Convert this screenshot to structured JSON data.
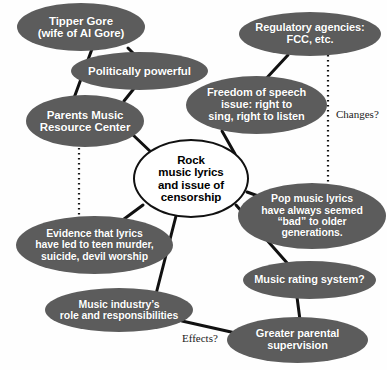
{
  "diagram": {
    "colors": {
      "oval_fill": "#5c5c5c",
      "oval_text": "#ffffff",
      "center_fill": "#ffffff",
      "center_text": "#000000",
      "edge": "#111111",
      "background": "#fefefe"
    },
    "nodes": [
      {
        "id": "tipper-gore",
        "label": "Tipper  Gore\n(wife of Al Gore)",
        "shape": "ellipse",
        "x": 17,
        "y": 3,
        "w": 128,
        "h": 48,
        "font_size": 11.5
      },
      {
        "id": "politically-powerful",
        "label": "Politically powerful",
        "shape": "ellipse",
        "x": 71,
        "y": 52,
        "w": 137,
        "h": 38,
        "font_size": 11.5
      },
      {
        "id": "regulatory-agencies",
        "label": "Regulatory agencies:\nFCC, etc.",
        "shape": "ellipse",
        "x": 239,
        "y": 12,
        "w": 142,
        "h": 44,
        "font_size": 11
      },
      {
        "id": "freedom-of-speech",
        "label": "Freedom of speech\nissue: right to\nsing, right to listen",
        "shape": "ellipse",
        "x": 186,
        "y": 76,
        "w": 141,
        "h": 58,
        "font_size": 11
      },
      {
        "id": "parents-music-resource-center",
        "label": "Parents Music\nResource Center",
        "shape": "ellipse",
        "x": 26,
        "y": 95,
        "w": 118,
        "h": 52,
        "font_size": 11.5
      },
      {
        "id": "rock-music-lyrics-censorship",
        "label": "Rock\nmusic lyrics\nand issue of\ncensorship",
        "shape": "circle",
        "x": 133,
        "y": 139,
        "w": 116,
        "h": 79,
        "font_size": 11.5
      },
      {
        "id": "pop-music-lyrics",
        "label": "Pop music lyrics\nhave always seemed\n“bad” to older\ngenerations.",
        "shape": "ellipse",
        "x": 238,
        "y": 183,
        "w": 148,
        "h": 66,
        "font_size": 10.5
      },
      {
        "id": "evidence-that-lyrics",
        "label": "Evidence that lyrics\nhave led to teen murder,\nsuicide, devil worship",
        "shape": "ellipse",
        "x": 16,
        "y": 216,
        "w": 157,
        "h": 58,
        "font_size": 10.5
      },
      {
        "id": "music-rating-system",
        "label": "Music rating system?",
        "shape": "ellipse",
        "x": 243,
        "y": 261,
        "w": 133,
        "h": 38,
        "font_size": 11
      },
      {
        "id": "music-industry-role",
        "label": "Music industry’s\nrole and responsibilities",
        "shape": "ellipse",
        "x": 45,
        "y": 288,
        "w": 148,
        "h": 44,
        "font_size": 10.5
      },
      {
        "id": "greater-parental-supervision",
        "label": "Greater parental\nsupervision",
        "shape": "ellipse",
        "x": 227,
        "y": 317,
        "w": 141,
        "h": 46,
        "font_size": 11
      }
    ],
    "edges": [
      {
        "id": "tipper-to-pmrc",
        "from": "tipper-gore",
        "to": "parents-music-resource-center",
        "style": "solid",
        "x1": 92,
        "y1": 49,
        "x2": 74,
        "y2": 98
      },
      {
        "id": "tipper-to-politically-powerful",
        "from": "tipper-gore",
        "to": "politically-powerful",
        "style": "solid",
        "x1": 128,
        "y1": 48,
        "x2": 137,
        "y2": 57
      },
      {
        "id": "politically-powerful-to-pmrc",
        "from": "politically-powerful",
        "to": "parents-music-resource-center",
        "style": "solid",
        "x1": 136,
        "y1": 86,
        "x2": 124,
        "y2": 101
      },
      {
        "id": "regulatory-to-freedom",
        "from": "regulatory-agencies",
        "to": "freedom-of-speech",
        "style": "solid",
        "x1": 288,
        "y1": 55,
        "x2": 250,
        "y2": 96
      },
      {
        "id": "regulatory-to-pop-music",
        "from": "regulatory-agencies",
        "to": "pop-music-lyrics",
        "style": "dotted",
        "x1": 328,
        "y1": 55,
        "x2": 328,
        "y2": 186
      },
      {
        "id": "pmrc-to-evidence",
        "from": "parents-music-resource-center",
        "to": "evidence-that-lyrics",
        "style": "dotted",
        "x1": 79,
        "y1": 148,
        "x2": 79,
        "y2": 219
      },
      {
        "id": "pmrc-to-center",
        "from": "parents-music-resource-center",
        "to": "rock-music-lyrics-censorship",
        "style": "solid",
        "x1": 132,
        "y1": 134,
        "x2": 153,
        "y2": 154
      },
      {
        "id": "freedom-to-center",
        "from": "freedom-of-speech",
        "to": "rock-music-lyrics-censorship",
        "style": "solid",
        "x1": 222,
        "y1": 131,
        "x2": 235,
        "y2": 154
      },
      {
        "id": "center-to-pop-music",
        "from": "rock-music-lyrics-censorship",
        "to": "pop-music-lyrics",
        "style": "solid",
        "x1": 247,
        "y1": 192,
        "x2": 272,
        "y2": 201
      },
      {
        "id": "center-to-evidence",
        "from": "rock-music-lyrics-censorship",
        "to": "evidence-that-lyrics",
        "style": "solid",
        "x1": 143,
        "y1": 205,
        "x2": 120,
        "y2": 222
      },
      {
        "id": "center-to-music-industry",
        "from": "rock-music-lyrics-censorship",
        "to": "music-industry-role",
        "style": "solid",
        "x1": 176,
        "y1": 216,
        "x2": 156,
        "y2": 294
      },
      {
        "id": "center-to-music-rating",
        "from": "rock-music-lyrics-censorship",
        "to": "music-rating-system",
        "style": "solid",
        "x1": 236,
        "y1": 205,
        "x2": 288,
        "y2": 264
      },
      {
        "id": "music-rating-to-greater-parental",
        "from": "music-rating-system",
        "to": "greater-parental-supervision",
        "style": "solid",
        "x1": 297,
        "y1": 297,
        "x2": 300,
        "y2": 320
      },
      {
        "id": "music-industry-to-greater-parental",
        "from": "music-industry-role",
        "to": "greater-parental-supervision",
        "style": "solid",
        "x1": 182,
        "y1": 321,
        "x2": 240,
        "y2": 334
      }
    ],
    "edge_labels": [
      {
        "id": "changes-label",
        "text": "Changes?",
        "x": 336,
        "y": 108,
        "font_size": 11
      },
      {
        "id": "effects-label",
        "text": "Effects?",
        "x": 182,
        "y": 332,
        "font_size": 11
      }
    ]
  }
}
